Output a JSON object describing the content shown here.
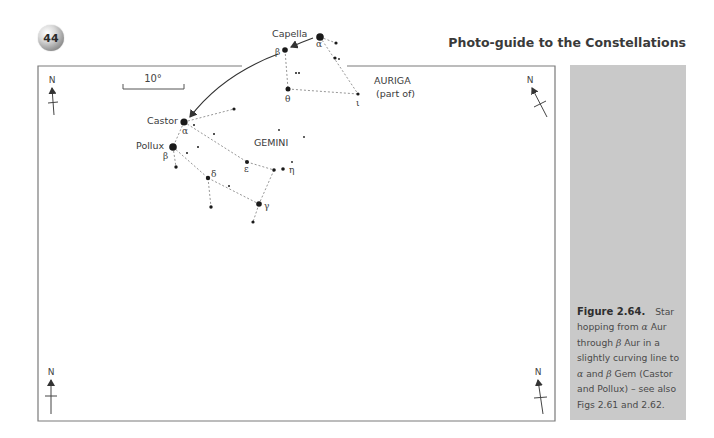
{
  "page": {
    "number": "44",
    "running_head": "Photo-guide to the Constellations"
  },
  "figure": {
    "scale_bar_label": "10°",
    "north_label": "N",
    "constellations": [
      {
        "name": "AURIGA",
        "note": "(part of)"
      },
      {
        "name": "GEMINI"
      }
    ],
    "star_labels": {
      "capella": "Capella",
      "castor": "Castor",
      "pollux": "Pollux",
      "alpha_aur": "α",
      "beta_aur": "β",
      "theta_aur": "θ",
      "iota_aur": "ι",
      "alpha_gem": "α",
      "beta_gem": "β",
      "delta_gem": "δ",
      "epsilon_gem": "ε",
      "eta_gem": "η",
      "gamma_gem": "γ"
    },
    "colors": {
      "frame": "#7a7a7a",
      "star": "#1a1a1a",
      "dashed_line": "#8a8a8a",
      "caption_bg": "#c9c9c9"
    }
  },
  "caption": {
    "label": "Figure 2.64.",
    "text_1": "Star hopping from ",
    "alpha1": "α",
    "text_2": " Aur through ",
    "beta1": "β",
    "text_3": " Aur in a slightly curving line to ",
    "alpha2": "α",
    "text_4": " and ",
    "beta2": "β",
    "text_5": " Gem (Castor and Pollux) – see also Figs 2.61 and 2.62."
  }
}
